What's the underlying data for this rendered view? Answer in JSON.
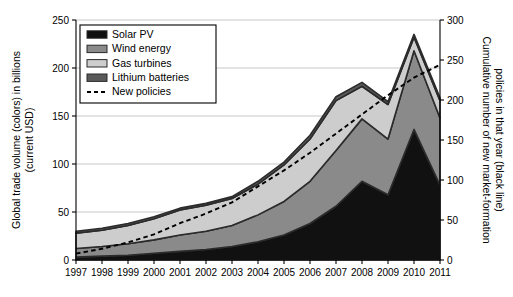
{
  "chart_data": {
    "type": "area",
    "title": "",
    "subtitle": "",
    "stacked": true,
    "x": [
      1997,
      1998,
      1999,
      2000,
      2001,
      2002,
      2003,
      2004,
      2005,
      2006,
      2007,
      2008,
      2009,
      2010,
      2011
    ],
    "categories": [
      "1997",
      "1998",
      "1999",
      "2000",
      "2001",
      "2002",
      "2003",
      "2004",
      "2005",
      "2006",
      "2007",
      "2008",
      "2009",
      "2010",
      "2011"
    ],
    "xlabel": "",
    "ylabel": "Global trade volume (colors) in billions (current USD)",
    "y2label": "Cumulative number of new market-formation policies in that year (black line)",
    "ylim": [
      0,
      250
    ],
    "y2lim": [
      0,
      300
    ],
    "yticks": [
      0,
      50,
      100,
      150,
      200,
      250
    ],
    "y2ticks": [
      0,
      50,
      100,
      150,
      200,
      250,
      300
    ],
    "xticks": [
      "1997",
      "1998",
      "1999",
      "2000",
      "2001",
      "2002",
      "2003",
      "2004",
      "2005",
      "2006",
      "2007",
      "2008",
      "2009",
      "2010",
      "2011"
    ],
    "grid": true,
    "grid_axis": "y",
    "legend_position": "upper-left",
    "series": [
      {
        "name": "Solar PV",
        "color": "#111111",
        "kind": "area",
        "axis": "left",
        "values": [
          3,
          4,
          5,
          7,
          9,
          11,
          14,
          19,
          26,
          38,
          56,
          82,
          68,
          136,
          78
        ]
      },
      {
        "name": "Wind energy",
        "color": "#8a8a8a",
        "kind": "area",
        "axis": "left",
        "values": [
          9,
          10,
          12,
          14,
          17,
          19,
          22,
          28,
          35,
          44,
          58,
          65,
          58,
          82,
          70
        ]
      },
      {
        "name": "Gas turbines",
        "color": "#cdcdcd",
        "kind": "area",
        "axis": "left",
        "values": [
          16,
          17,
          19,
          22,
          26,
          27,
          28,
          32,
          38,
          44,
          52,
          34,
          36,
          14,
          18
        ]
      },
      {
        "name": "Lithium batteries",
        "color": "#5a5a5a",
        "kind": "area",
        "axis": "left",
        "values": [
          2,
          2,
          2,
          2,
          2,
          2,
          2,
          3,
          3,
          4,
          4,
          4,
          3,
          3,
          3
        ]
      },
      {
        "name": "New policies",
        "color": "#000000",
        "kind": "dashed-line",
        "axis": "right",
        "values": [
          8,
          14,
          22,
          32,
          46,
          58,
          72,
          92,
          112,
          134,
          158,
          182,
          206,
          228,
          244
        ]
      }
    ]
  },
  "legend": {
    "items": [
      {
        "label": "Solar PV",
        "swatch": "#111111",
        "style": "block"
      },
      {
        "label": "Wind energy",
        "swatch": "#8a8a8a",
        "style": "block"
      },
      {
        "label": "Gas turbines",
        "swatch": "#cdcdcd",
        "style": "block"
      },
      {
        "label": "Lithium batteries",
        "swatch": "#5a5a5a",
        "style": "block"
      },
      {
        "label": "New policies",
        "swatch": "#000000",
        "style": "dashed"
      }
    ]
  },
  "axes": {
    "left_label": "Global trade volume (colors) in billions (current USD)",
    "left_label_line1": "Global trade volume (colors) in billions",
    "left_label_line2": "(current USD)",
    "right_label": "Cumulative number of new market-formation policies in that year (black line)",
    "right_label_line1": "Cumulative number of new market-formation",
    "right_label_line2": "policies in that year (black line)",
    "left_ticks": [
      "0",
      "50",
      "100",
      "150",
      "200",
      "250"
    ],
    "right_ticks": [
      "0",
      "50",
      "100",
      "150",
      "200",
      "250",
      "300"
    ],
    "x_ticks": [
      "1997",
      "1998",
      "1999",
      "2000",
      "2001",
      "2002",
      "2003",
      "2004",
      "2005",
      "2006",
      "2007",
      "2008",
      "2009",
      "2010",
      "2011"
    ]
  }
}
